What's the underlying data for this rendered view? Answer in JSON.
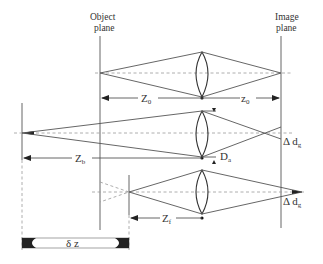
{
  "diagram": {
    "labels": {
      "object_plane": [
        "Object",
        "plane"
      ],
      "image_plane": [
        "Image",
        "plane"
      ],
      "z_object": {
        "main": "Z",
        "sub": "0"
      },
      "z_image": {
        "main": "z",
        "sub": "0"
      },
      "z_b": {
        "main": "Z",
        "sub": "b"
      },
      "z_f": {
        "main": "Z",
        "sub": "f"
      },
      "d_a": {
        "main": "D",
        "sub": "a"
      },
      "delta_dg_upper": {
        "main": "Δ d",
        "sub": "g"
      },
      "delta_dg_lower": {
        "main": "Δ d",
        "sub": "g"
      },
      "delta_z": "δ z"
    },
    "colors": {
      "line": "#555555",
      "dashed": "#999999",
      "text": "#333333"
    }
  }
}
